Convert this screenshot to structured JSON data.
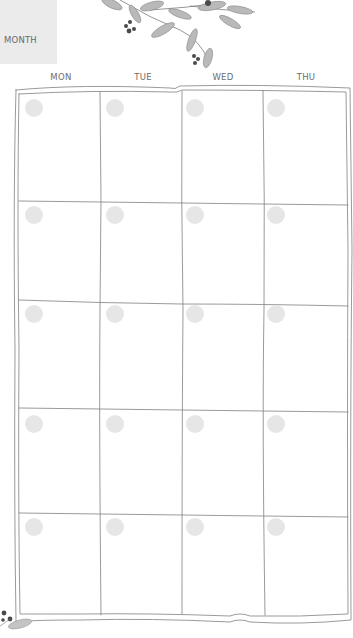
{
  "banner": {
    "label": "MONTH",
    "color": "#ebebeb"
  },
  "weekdays": [
    {
      "label": "MON",
      "x": 61
    },
    {
      "label": "TUE",
      "x": 143
    },
    {
      "label": "WED",
      "x": 223
    },
    {
      "label": "THU",
      "x": 306
    }
  ],
  "grid": {
    "columns": 4,
    "rows": 5,
    "line_color": "#7a7a7a",
    "circle_color": "#e6e6e6"
  },
  "decoration": {
    "top": "olive-branch-illustration",
    "bottom_left": "olive-berries-illustration"
  }
}
